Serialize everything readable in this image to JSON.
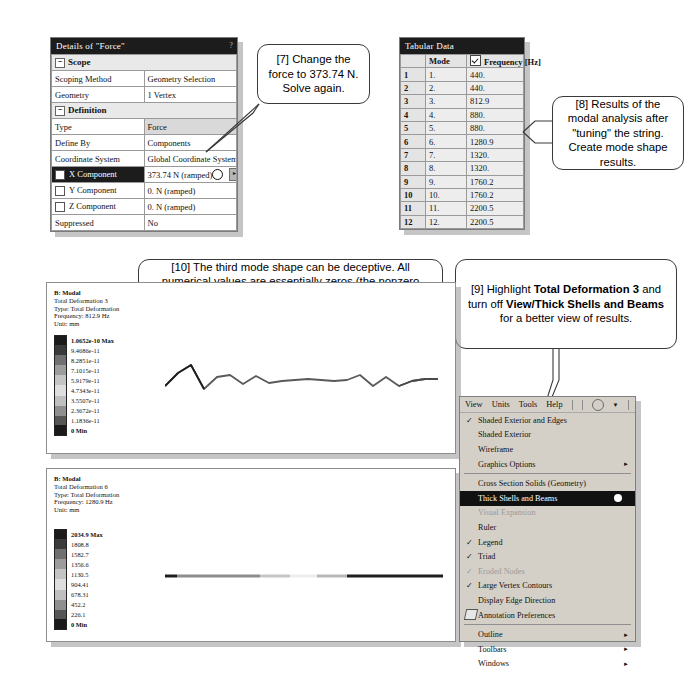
{
  "details_panel": {
    "title": "Details of \"Force\"",
    "help_glyph": "?",
    "rows": [
      {
        "type": "section",
        "label": "Scope"
      },
      {
        "type": "row",
        "label": "Scoping Method",
        "value": "Geometry Selection"
      },
      {
        "type": "row",
        "label": "Geometry",
        "value": "1 Vertex"
      },
      {
        "type": "section",
        "label": "Definition"
      },
      {
        "type": "row",
        "label": "Type",
        "value": "Force",
        "shaded": true
      },
      {
        "type": "row",
        "label": "Define By",
        "value": "Components"
      },
      {
        "type": "row",
        "label": "Coordinate System",
        "value": "Global Coordinate System"
      },
      {
        "type": "row",
        "label": "X Component",
        "value": "373.74 N (ramped)",
        "highlight": true,
        "checkbox": true,
        "spinner": true
      },
      {
        "type": "row",
        "label": "Y Component",
        "value": "0. N (ramped)",
        "checkbox": true
      },
      {
        "type": "row",
        "label": "Z Component",
        "value": "0. N (ramped)",
        "checkbox": true
      },
      {
        "type": "row",
        "label": "Suppressed",
        "value": "No"
      }
    ]
  },
  "tabular_data": {
    "title": "Tabular Data",
    "headers": [
      "",
      "Mode",
      "Frequency [Hz]"
    ],
    "rows": [
      {
        "idx": "1",
        "mode": "1.",
        "freq": "440."
      },
      {
        "idx": "2",
        "mode": "2.",
        "freq": "440."
      },
      {
        "idx": "3",
        "mode": "3.",
        "freq": "812.9"
      },
      {
        "idx": "4",
        "mode": "4.",
        "freq": "880."
      },
      {
        "idx": "5",
        "mode": "5.",
        "freq": "880."
      },
      {
        "idx": "6",
        "mode": "6.",
        "freq": "1280.9"
      },
      {
        "idx": "7",
        "mode": "7.",
        "freq": "1320."
      },
      {
        "idx": "8",
        "mode": "8.",
        "freq": "1320."
      },
      {
        "idx": "9",
        "mode": "9.",
        "freq": "1760.2"
      },
      {
        "idx": "10",
        "mode": "10.",
        "freq": "1760.2"
      },
      {
        "idx": "11",
        "mode": "11.",
        "freq": "2200.5"
      },
      {
        "idx": "12",
        "mode": "12.",
        "freq": "2200.5"
      }
    ]
  },
  "callouts": {
    "c7": "[7] Change the force to 373.74 N. Solve again.",
    "c8": "[8] Results of the modal analysis after \"tuning\" the string. Create mode shape results.",
    "c10": "[10] The third mode shape can be deceptive. All numerical values are essentially zeros (the nonzero values are numerical errors).  It is simply a straight line. The mode is the rotation in X-direction.  It is a rotation mode. We could have fixed X-rotation at both ends to avoid this mode.",
    "c9_parts": {
      "p1": "[9] Highlight ",
      "b1": "Total Deformation 3",
      "p2": " and turn off ",
      "b2": "View/Thick Shells and Beams",
      "p3": " for a better view of results."
    },
    "c11": "[11] The sixth mode is a stretching mode. #"
  },
  "result_top": {
    "header": [
      "B: Modal",
      "Total Deformation 3",
      "Type: Total Deformation",
      "Frequency: 812.9 Hz",
      "Unit: mm"
    ],
    "legend": [
      "1.0652e-10 Max",
      "9.4686e-11",
      "8.2851e-11",
      "7.1015e-11",
      "5.9179e-11",
      "4.7343e-11",
      "3.5507e-11",
      "2.3672e-11",
      "1.1836e-11",
      "0 Min"
    ]
  },
  "result_bottom": {
    "header": [
      "B: Modal",
      "Total Deformation 6",
      "Type: Total Deformation",
      "Frequency: 1280.9 Hz",
      "Unit: mm"
    ],
    "legend": [
      "2034.9 Max",
      "1808.8",
      "1582.7",
      "1356.6",
      "1130.5",
      "904.41",
      "678.31",
      "452.2",
      "226.1",
      "0 Min"
    ]
  },
  "view_menu": {
    "menubar": [
      "View",
      "Units",
      "Tools",
      "Help"
    ],
    "items": [
      {
        "label": "Shaded Exterior and Edges",
        "checked": true
      },
      {
        "label": "Shaded Exterior",
        "checked": false
      },
      {
        "label": "Wireframe",
        "checked": false
      },
      {
        "label": "Graphics Options",
        "checked": false,
        "submenu": true
      },
      {
        "divider": true
      },
      {
        "label": "Cross Section Solids (Geometry)",
        "checked": false
      },
      {
        "label": "Thick Shells and Beams",
        "checked": false,
        "selected": true,
        "dot": true
      },
      {
        "label": "Visual Expansion",
        "checked": false,
        "disabled": true
      },
      {
        "label": "Ruler",
        "checked": false
      },
      {
        "label": "Legend",
        "checked": true
      },
      {
        "label": "Triad",
        "checked": true
      },
      {
        "label": "Eroded Nodes",
        "checked": true,
        "disabled": true
      },
      {
        "label": "Large Vertex Contours",
        "checked": true
      },
      {
        "label": "Display Edge Direction",
        "checked": false
      },
      {
        "label": "Annotation Preferences",
        "checked": false,
        "icon": "annotation-icon"
      },
      {
        "divider": true
      },
      {
        "label": "Outline",
        "checked": false,
        "submenu": true
      },
      {
        "label": "Toolbars",
        "checked": false,
        "submenu": true
      },
      {
        "label": "Windows",
        "checked": false,
        "submenu": true
      }
    ]
  },
  "colors": {
    "title_bar": "#1c1c1c",
    "menu_face": "#d4d0c8",
    "grid_line": "#9a9a9a"
  }
}
